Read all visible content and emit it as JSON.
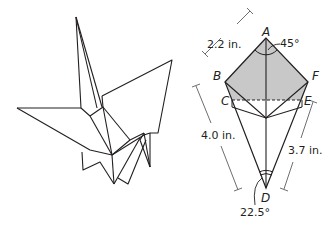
{
  "figure": {
    "left_panel": {
      "subject": "origami crane line drawing"
    },
    "right_panel": {
      "subject": "kite diagram of crane fold",
      "points": {
        "A": "A",
        "B": "B",
        "C": "C",
        "D": "D",
        "E": "E",
        "F": "F"
      },
      "measurements": {
        "AB": "2.2 in.",
        "BD": "4.0 in.",
        "ED": "3.7 in."
      },
      "angles": {
        "A": "45°",
        "D": "22.5°"
      },
      "colors": {
        "shaded_region": "#c8c8c8",
        "stroke": "#231f20",
        "dimension_line": "#6d6e71"
      }
    }
  }
}
